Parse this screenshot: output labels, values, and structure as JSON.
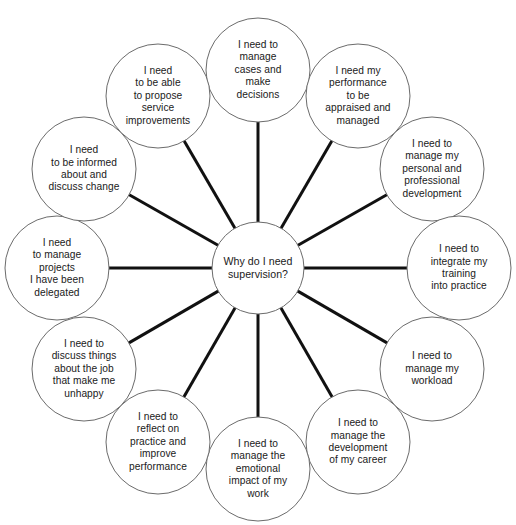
{
  "diagram": {
    "title": "Why do I need supervision?",
    "type": "radial-mind-map",
    "center": {
      "label": "Why do I need\nsupervision?",
      "cx": 258,
      "cy": 268,
      "r": 46
    },
    "geometry": {
      "outer_radius": 52,
      "ring_radius": 201,
      "spoke_color": "#111111",
      "spoke_width": 3,
      "circle_stroke": "#6b6b6b",
      "circle_stroke_width": 1,
      "circle_fill": "#ffffff",
      "text_color": "#1a1a1a",
      "background": "#ffffff"
    },
    "nodes": [
      {
        "id": "manage-cases-and-make-decisions",
        "label": "I need to\nmanage\ncases and\nmake\ndecisions",
        "cx": 258,
        "cy": 70,
        "angle_deg": -90
      },
      {
        "id": "performance-appraised-and-managed",
        "label": "I need my\nperformance\nto be\nappraised and\nmanaged",
        "cx": 358,
        "cy": 96,
        "angle_deg": -60
      },
      {
        "id": "manage-personal-and-professional-development",
        "label": "I need to\nmanage my\npersonal and\nprofessional\ndevelopment",
        "cx": 432,
        "cy": 169,
        "angle_deg": -30
      },
      {
        "id": "integrate-training-into-practice",
        "label": "I need to\nintegrate my\ntraining\ninto practice",
        "cx": 459,
        "cy": 268,
        "angle_deg": 0
      },
      {
        "id": "manage-my-workload",
        "label": "I need to\nmanage my\nworkload",
        "cx": 432,
        "cy": 369,
        "angle_deg": 30
      },
      {
        "id": "manage-development-of-my-career",
        "label": "I need to\nmanage the\ndevelopment\nof my career",
        "cx": 358,
        "cy": 442,
        "angle_deg": 60
      },
      {
        "id": "manage-emotional-impact-of-my-work",
        "label": "I need to\nmanage the\nemotional\nimpact of my\nwork",
        "cx": 258,
        "cy": 469,
        "angle_deg": 90
      },
      {
        "id": "reflect-on-practice-and-improve-performance",
        "label": "I need to\nreflect on\npractice and\nimprove\nperformance",
        "cx": 158,
        "cy": 442,
        "angle_deg": 120
      },
      {
        "id": "discuss-things-that-make-me-unhappy",
        "label": "I need to\ndiscuss things\nabout the job\nthat make me\nunhappy",
        "cx": 84,
        "cy": 369,
        "angle_deg": 150
      },
      {
        "id": "manage-delegated-projects",
        "label": "I need\nto manage\nprojects\nI have been\ndelegated",
        "cx": 57,
        "cy": 268,
        "angle_deg": 180
      },
      {
        "id": "be-informed-about-and-discuss-change",
        "label": "I need\nto be informed\nabout and\ndiscuss change",
        "cx": 84,
        "cy": 169,
        "angle_deg": 210
      },
      {
        "id": "propose-service-improvements",
        "label": "I need\nto be able\nto propose\nservice\nimprovements",
        "cx": 158,
        "cy": 96,
        "angle_deg": 240
      }
    ]
  }
}
